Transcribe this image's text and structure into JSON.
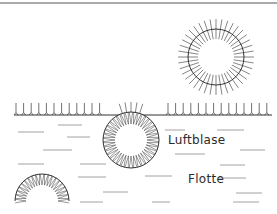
{
  "labels": {
    "bubble": "Luftblase",
    "liquid": "Flotte"
  },
  "colors": {
    "stroke": "#333333",
    "frame": "#555555",
    "dash": "#8a8a8a",
    "background": "#ffffff"
  },
  "geometry": {
    "surface_y": 115,
    "bubbles": [
      {
        "name": "free-bubble",
        "cx": 216,
        "cy": 57,
        "r": 28,
        "spike_in": 10,
        "spike_out": 10,
        "count": 40
      },
      {
        "name": "surface-bubble",
        "cx": 131,
        "cy": 140,
        "r": 28,
        "spike_in": 12,
        "count": 40
      },
      {
        "name": "submerged-bubble",
        "cx": 42,
        "cy": 201,
        "r": 27,
        "spike_in": 11,
        "count": 20
      }
    ],
    "dashes": [
      [
        18,
        132,
        44
      ],
      [
        58,
        125,
        82
      ],
      [
        67,
        137,
        90
      ],
      [
        43,
        150,
        72
      ],
      [
        18,
        164,
        44
      ],
      [
        80,
        164,
        106
      ],
      [
        78,
        177,
        106
      ],
      [
        103,
        192,
        128
      ],
      [
        80,
        202,
        103
      ],
      [
        165,
        130,
        185
      ],
      [
        217,
        130,
        244
      ],
      [
        175,
        154,
        205
      ],
      [
        240,
        150,
        265
      ],
      [
        220,
        165,
        245
      ],
      [
        145,
        176,
        172
      ],
      [
        218,
        178,
        246
      ],
      [
        236,
        193,
        262
      ],
      [
        152,
        202,
        170
      ],
      [
        233,
        202,
        259
      ]
    ]
  }
}
